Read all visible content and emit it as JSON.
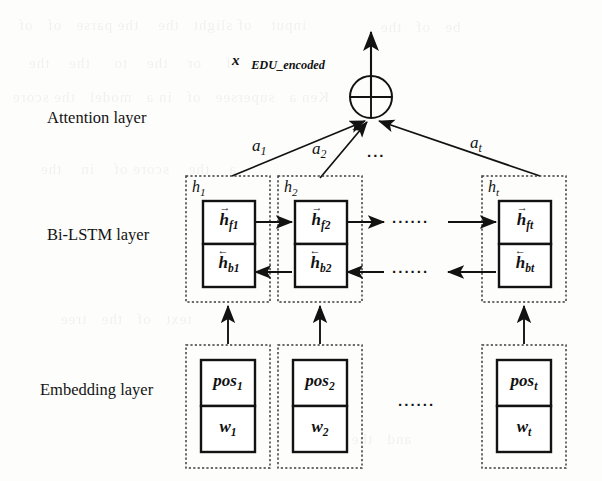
{
  "figure": {
    "type": "neural-network-architecture",
    "output_label": "x⃗",
    "output_subscript": "EDU_encoded"
  },
  "layers": [
    {
      "id": "attention",
      "label": "Attention layer"
    },
    {
      "id": "bilstm",
      "label": "Bi-LSTM layer"
    },
    {
      "id": "embedding",
      "label": "Embedding layer"
    }
  ],
  "attention": {
    "sum_node": "⊕",
    "weights": [
      {
        "label": "a",
        "sub": "1"
      },
      {
        "label": "a",
        "sub": "2"
      },
      {
        "label": "a",
        "sub": "t"
      }
    ],
    "ellipsis": "..."
  },
  "bilstm": {
    "groups": [
      {
        "group_label": "h",
        "group_sub": "1",
        "forward": {
          "base": "h",
          "sub": "f1",
          "accent": "right"
        },
        "backward": {
          "base": "h",
          "sub": "b1",
          "accent": "left"
        }
      },
      {
        "group_label": "h",
        "group_sub": "2",
        "forward": {
          "base": "h",
          "sub": "f2",
          "accent": "right"
        },
        "backward": {
          "base": "h",
          "sub": "b2",
          "accent": "left"
        }
      },
      {
        "group_label": "h",
        "group_sub": "t",
        "forward": {
          "base": "h",
          "sub": "ft",
          "accent": "right"
        },
        "backward": {
          "base": "h",
          "sub": "bt",
          "accent": "left"
        }
      }
    ],
    "ellipsis_forward": "······",
    "ellipsis_backward": "······"
  },
  "embedding": {
    "groups": [
      {
        "pos": "pos",
        "pos_sub": "1",
        "word": "w",
        "word_sub": "1"
      },
      {
        "pos": "pos",
        "pos_sub": "2",
        "word": "w",
        "word_sub": "2"
      },
      {
        "pos": "pos",
        "pos_sub": "t",
        "word": "w",
        "word_sub": "t"
      }
    ],
    "ellipsis": "······"
  },
  "style": {
    "ink": "#121212",
    "paper": "#fdfdfc",
    "dashed_border": "#3a3a3a"
  },
  "bleed_text": [
    "input",
    "of slight",
    "the",
    "the parse",
    "of",
    "of",
    "of",
    "or",
    "the",
    "to",
    "the",
    "the",
    "Ken a",
    "supersee",
    "of",
    "in a",
    "model",
    "the score"
  ]
}
